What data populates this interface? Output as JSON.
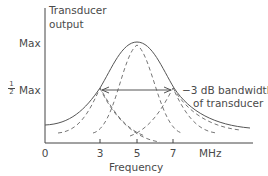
{
  "diagram": {
    "y_axis_title_line1": "Transducer",
    "y_axis_title_line2": "output",
    "y_label_max": "Max",
    "y_label_half_num": "1",
    "y_label_half_den": "2",
    "y_label_half_text": "Max",
    "x_axis_title": "Frequency",
    "x_ticks": [
      "0",
      "3",
      "5",
      "7"
    ],
    "x_unit": "MHz",
    "annotation_line1": "−3 dB bandwidth",
    "annotation_line2": "of transducer",
    "colors": {
      "axis": "#444444",
      "curve": "#555555",
      "text": "#4a4a4a"
    }
  }
}
